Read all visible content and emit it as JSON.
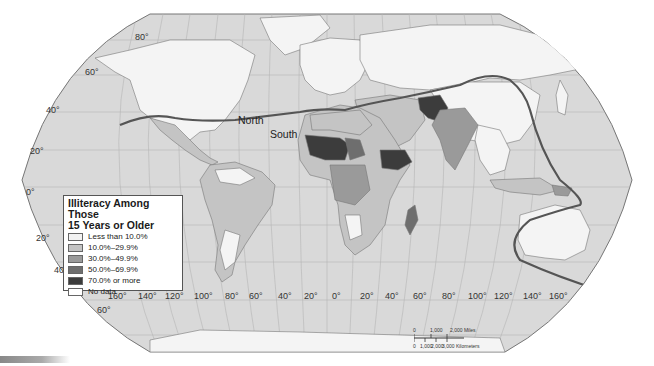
{
  "legend": {
    "title_line1": "Illiteracy Among Those",
    "title_line2": "15 Years or Older",
    "items": [
      {
        "label": "Less than 10.0%",
        "color": "#f2f2f2"
      },
      {
        "label": "10.0%–29.9%",
        "color": "#c4c4c4"
      },
      {
        "label": "30.0%–49.9%",
        "color": "#9a9a9a"
      },
      {
        "label": "50.0%–69.9%",
        "color": "#6e6e6e"
      },
      {
        "label": "70.0% or more",
        "color": "#3c3c3c"
      },
      {
        "label": "No data",
        "color": "#ffffff"
      }
    ]
  },
  "regions": {
    "north_label": "North",
    "south_label": "South"
  },
  "latitude_labels": [
    "80°",
    "60°",
    "40°",
    "20°",
    "0°",
    "20°",
    "40°",
    "60°"
  ],
  "longitude_labels": [
    "160°",
    "140°",
    "120°",
    "100°",
    "80°",
    "60°",
    "40°",
    "20°",
    "0°",
    "20°",
    "40°",
    "60°",
    "80°",
    "100°",
    "120°",
    "140°",
    "160°"
  ],
  "scale": {
    "miles": [
      "0",
      "1,000",
      "2,000 Miles"
    ],
    "kilometers": [
      "0",
      "1,000",
      "2,000",
      "3,000 Kilometers"
    ]
  },
  "colors": {
    "ocean": "#d9d9d9",
    "land_low": "#f4f4f4",
    "divide_line": "#555555",
    "graticule": "#b0b0b0"
  }
}
